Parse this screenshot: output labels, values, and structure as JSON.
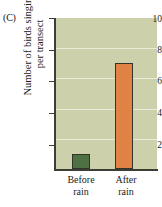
{
  "panel": {
    "label": "(C)"
  },
  "chart_data": {
    "type": "bar",
    "title": "",
    "subtitle": "",
    "xlabel": "",
    "ylabel": "Number of birds singing per transect",
    "ylabel_lines": [
      "Number of birds singing",
      "per transect"
    ],
    "categories": [
      "Before rain",
      "After rain"
    ],
    "category_lines": [
      [
        "Before",
        "rain"
      ],
      [
        "After",
        "rain"
      ]
    ],
    "values": [
      1,
      7
    ],
    "ylim": [
      0,
      10
    ],
    "yticks": [
      2,
      4,
      6,
      8,
      10
    ],
    "ytick_labels": [
      "2",
      "4",
      "6",
      "8",
      "10"
    ],
    "grid": true,
    "legend": "none",
    "colors": {
      "bar_before": "#4e7043",
      "bar_after": "#e08243",
      "bar_edge": "#33332c",
      "plot_background": "#ccd1ab",
      "gridline": "#eef0e0",
      "axis": "#3d3d36",
      "text": "#1c1c1a"
    }
  }
}
